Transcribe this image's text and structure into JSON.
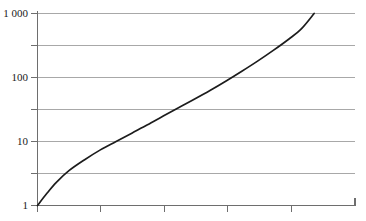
{
  "chart_data": {
    "type": "line",
    "title": "",
    "subtitle": "",
    "xlabel": "",
    "ylabel": "",
    "yscale": "log",
    "xscale": "linear",
    "grid": true,
    "legend": false,
    "ylim": [
      1,
      1000
    ],
    "xlim": [
      0,
      5.05
    ],
    "y_ticks": [
      1,
      10,
      100,
      1000
    ],
    "y_tick_labels": [
      "1",
      "10",
      "100",
      "1 000"
    ],
    "y_gridline_values": [
      1,
      3.162,
      10,
      31.62,
      100,
      316.2,
      1000
    ],
    "x_ticks": [
      0,
      1,
      2,
      3,
      4,
      5
    ],
    "x_tick_labels": [
      "",
      "",
      "",
      "",
      "",
      ""
    ],
    "series": [
      {
        "name": "curve",
        "color": "#1c1c1c",
        "x": [
          0.0,
          0.15,
          0.3,
          0.5,
          0.75,
          1.0,
          1.25,
          1.5,
          1.75,
          2.0,
          2.25,
          2.5,
          2.75,
          3.0,
          3.25,
          3.5,
          3.75,
          4.0,
          4.2,
          4.4
        ],
        "y": [
          1.0,
          1.55,
          2.3,
          3.5,
          5.2,
          7.4,
          10.0,
          13.5,
          18.2,
          25.0,
          34.0,
          46.0,
          63.0,
          88.0,
          125.0,
          180.0,
          265.0,
          400.0,
          580.0,
          1000.0
        ]
      }
    ],
    "annotations": []
  },
  "axes": {
    "y_axis_name": "y-axis-logarithmic",
    "x_axis_name": "x-axis-linear"
  },
  "labels": {
    "y1000": "1 000",
    "y100": "100",
    "y10": "10",
    "y1": "1"
  },
  "colors": {
    "curve": "#1c1c1c",
    "gridline": "#a8a8a8",
    "axis": "#6e6e6e",
    "background": "#ffffff",
    "text": "#1a1a1a"
  }
}
